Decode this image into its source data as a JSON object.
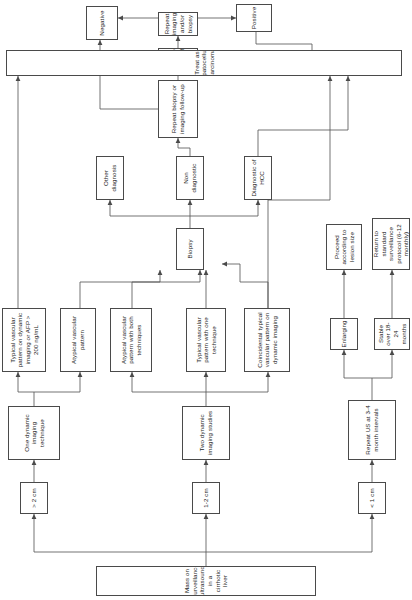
{
  "figure": {
    "type": "flowchart",
    "orientation": "rotated-90-ccw",
    "colors": {
      "box_stroke": "#4a4a4a",
      "edge_stroke": "#5a5a5a",
      "text": "#1a1a1a",
      "background": "#ffffff"
    }
  },
  "nodes": {
    "root": "Mass on surveillance ultrasound in a cirrhotic liver",
    "size_gt2": "> 2 cm",
    "size_1to2": "1-2 cm",
    "size_lt1": "< 1 cm",
    "one_dynamic": "One dynamic imaging technique",
    "two_dynamic": "Two dynamic imaging studies",
    "typical_afp": "Typical vascular pattern on dynamic imaging or AFP > 200 ng/mL",
    "atypical_pattern": "Atypical vascular pattern",
    "atypical_both": "Atypical vascular pattern with both techniques",
    "typical_one": "Typical vascular pattern with one technique",
    "coincidental_typical": "Coincidental typical vascular pattern on dynamic imaging",
    "biopsy": "Biopsy",
    "other_diagnosis": "Other diagnosis",
    "non_diagnostic": "Non diagnostic",
    "diagnostic_hcc": "Diagnostic of HCC",
    "repeat_biopsy": "Repeat biopsy or imaging follow-up",
    "change_size": "Change in size/profile",
    "repeat_imaging": "Repeat imaging and/or biopsy",
    "negative": "Negative",
    "positive": "Positive",
    "treat_hcc": "Treat as hepatocellular carcinoma",
    "repeat_us": "Repeat US at 3-4 month intervals",
    "enlarging": "Enlarging",
    "stable": "Stable over 18-24 months",
    "proceed_lesion": "Proceed according to lesion size",
    "return_surveillance": "Return to standard surveillance protocol (6-12 monthly)"
  }
}
